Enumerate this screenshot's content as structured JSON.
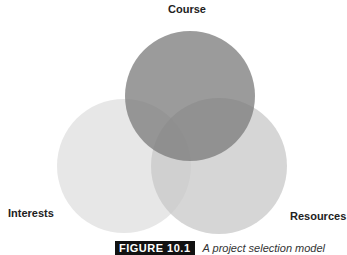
{
  "diagram": {
    "type": "venn",
    "circles": [
      {
        "label": "Course",
        "cx": 190,
        "cy": 96,
        "r": 65,
        "color": "#8c8c8c"
      },
      {
        "label": "Interests",
        "cx": 124,
        "cy": 166,
        "r": 67,
        "color": "#e6e6e6"
      },
      {
        "label": "Resources",
        "cx": 219,
        "cy": 166,
        "r": 68,
        "color": "#cfcfcf"
      }
    ]
  },
  "labels": {
    "course": "Course",
    "interests": "Interests",
    "resources": "Resources"
  },
  "caption": {
    "tag": "FIGURE 10.1",
    "text": "A project selection model"
  }
}
